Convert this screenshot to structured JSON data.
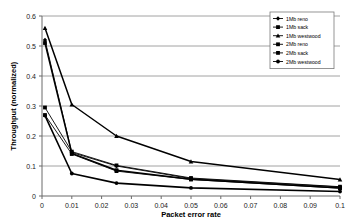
{
  "chart_data": {
    "type": "line",
    "title": "",
    "xlabel": "Packet error rate",
    "ylabel": "Throughput (normalized)",
    "xlim": [
      0,
      0.1
    ],
    "ylim": [
      0,
      0.6
    ],
    "grid": true,
    "grid_axis": "y",
    "legend_position": "top-right",
    "x": [
      0.001,
      0.01,
      0.025,
      0.05,
      0.1
    ],
    "xticks": [
      "0",
      "0.01",
      "0.02",
      "0.03",
      "0.04",
      "0.05",
      "0.06",
      "0.07",
      "0.08",
      "0.09",
      "0.1"
    ],
    "xtick_values": [
      0,
      0.01,
      0.02,
      0.03,
      0.04,
      0.05,
      0.06,
      0.07,
      0.08,
      0.09,
      0.1
    ],
    "yticks": [
      "0",
      "0.1",
      "0.2",
      "0.3",
      "0.4",
      "0.5",
      "0.6"
    ],
    "ytick_values": [
      0,
      0.1,
      0.2,
      0.3,
      0.4,
      0.5,
      0.6
    ],
    "series": [
      {
        "name": "1Mb reno",
        "marker": "diamond",
        "width": 0.9,
        "values": [
          0.52,
          0.145,
          0.1,
          0.058,
          0.03
        ]
      },
      {
        "name": "1Mb sack",
        "marker": "square",
        "width": 1.5,
        "values": [
          0.51,
          0.142,
          0.086,
          0.056,
          0.027
        ]
      },
      {
        "name": "1Mb westwood",
        "marker": "triangle",
        "width": 1.5,
        "values": [
          0.56,
          0.305,
          0.2,
          0.115,
          0.055
        ]
      },
      {
        "name": "2Mb reno",
        "marker": "cross",
        "width": 0.9,
        "values": [
          0.295,
          0.148,
          0.102,
          0.06,
          0.031
        ]
      },
      {
        "name": "2Mb sack",
        "marker": "square",
        "width": 0.9,
        "values": [
          0.27,
          0.14,
          0.083,
          0.055,
          0.026
        ]
      },
      {
        "name": "2Mb westwood",
        "marker": "circle",
        "width": 1.6,
        "values": [
          0.268,
          0.075,
          0.043,
          0.027,
          0.015
        ]
      }
    ]
  }
}
